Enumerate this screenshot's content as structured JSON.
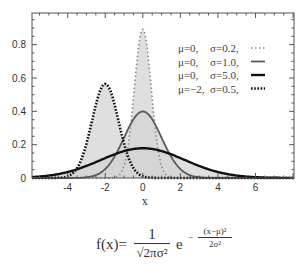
{
  "chart_data": {
    "type": "line",
    "title": "",
    "xlabel": "x",
    "ylabel": "",
    "xlim": [
      -5.9,
      8.05
    ],
    "ylim": [
      0,
      0.99
    ],
    "grid": false,
    "legend_position": "top-right",
    "x_ticks": [
      -4,
      -2,
      0,
      2,
      4,
      6
    ],
    "x_tick_labels": [
      "-4",
      "-2",
      "0",
      "2",
      "4",
      "6"
    ],
    "y_ticks": [
      0,
      0.2,
      0.4,
      0.6,
      0.8
    ],
    "y_tick_labels": [
      "0",
      "0.2",
      "0.4",
      "0.6",
      "0.8"
    ],
    "fill_under_curves": true,
    "fill_color": "#d4d4d4",
    "series": [
      {
        "name": "μ=0, σ=0.2",
        "mu_label": "μ=0,",
        "sigma_label": "σ=0.2,",
        "mu": 0,
        "variance": 0.2,
        "peak": 0.89,
        "style": "dotted-light",
        "color": "#8a8a8a"
      },
      {
        "name": "μ=0, σ=1.0",
        "mu_label": "μ=0,",
        "sigma_label": "σ=1.0,",
        "mu": 0,
        "variance": 1.0,
        "peak": 0.4,
        "style": "solid-medium",
        "color": "#5a5a5a"
      },
      {
        "name": "μ=0, σ=5.0",
        "mu_label": "μ=0,",
        "sigma_label": "σ=5.0,",
        "mu": 0,
        "variance": 5.0,
        "peak": 0.18,
        "style": "solid-thick",
        "color": "#111111"
      },
      {
        "name": "μ=−2, σ=0.5",
        "mu_label": "μ=−2,",
        "sigma_label": "σ=0.5,",
        "mu": -2,
        "variance": 0.5,
        "peak": 0.56,
        "style": "dotted-thick",
        "color": "#111111"
      }
    ]
  },
  "formula": {
    "lhs": "f(x)=",
    "numerator": "1",
    "denominator": "√2πσ²",
    "base": "e",
    "exp_sign": "−",
    "exp_numerator": "(x−μ)²",
    "exp_denominator": "2σ²"
  }
}
